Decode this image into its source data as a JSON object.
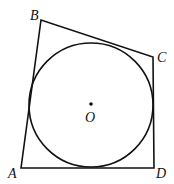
{
  "figure": {
    "points": {
      "A": {
        "label": "A",
        "x": 21,
        "y": 168
      },
      "B": {
        "label": "B",
        "x": 41,
        "y": 20
      },
      "C": {
        "label": "C",
        "x": 153,
        "y": 57
      },
      "D": {
        "label": "D",
        "x": 154,
        "y": 168
      }
    },
    "circle": {
      "center_label": "O",
      "cx": 91,
      "cy": 105,
      "r": 62
    },
    "stroke_color": "#111111"
  }
}
